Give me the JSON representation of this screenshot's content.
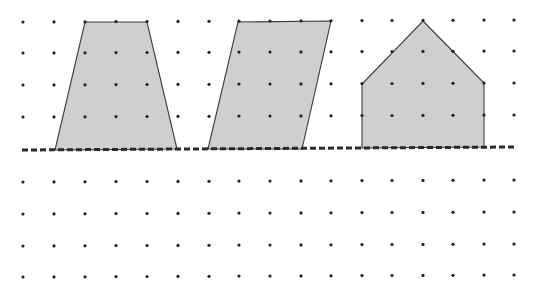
{
  "diagram": {
    "title": "Shapes on a dot grid resting on a dashed baseline",
    "grid": {
      "columns_x": [
        23,
        54,
        85,
        116,
        147,
        178,
        209,
        239,
        270,
        301,
        331,
        362,
        392,
        423,
        453,
        484,
        514
      ],
      "rows_above_y": [
        22,
        53,
        85,
        117
      ],
      "rows_below_y": [
        182,
        214,
        246,
        277
      ],
      "dot_radius": 1.6,
      "dot_color": "#222222"
    },
    "baseline": {
      "x1": 22,
      "y1": 150,
      "x2": 514,
      "y2": 147,
      "style": "dashed",
      "color": "#2a2a2a"
    },
    "shapes": [
      {
        "name": "trapezoid",
        "points": "85,22 147,22 177,149 55,150",
        "fill": "#cfcfcf",
        "stroke": "#3a3a3a"
      },
      {
        "name": "parallelogram",
        "points": "238,22 331,21 302,149 208,149",
        "fill": "#cfcfcf",
        "stroke": "#3a3a3a"
      },
      {
        "name": "pentagon-house",
        "points": "423,21 484,83 484,147 362,148 362,84",
        "fill": "#cfcfcf",
        "stroke": "#3a3a3a"
      }
    ]
  }
}
